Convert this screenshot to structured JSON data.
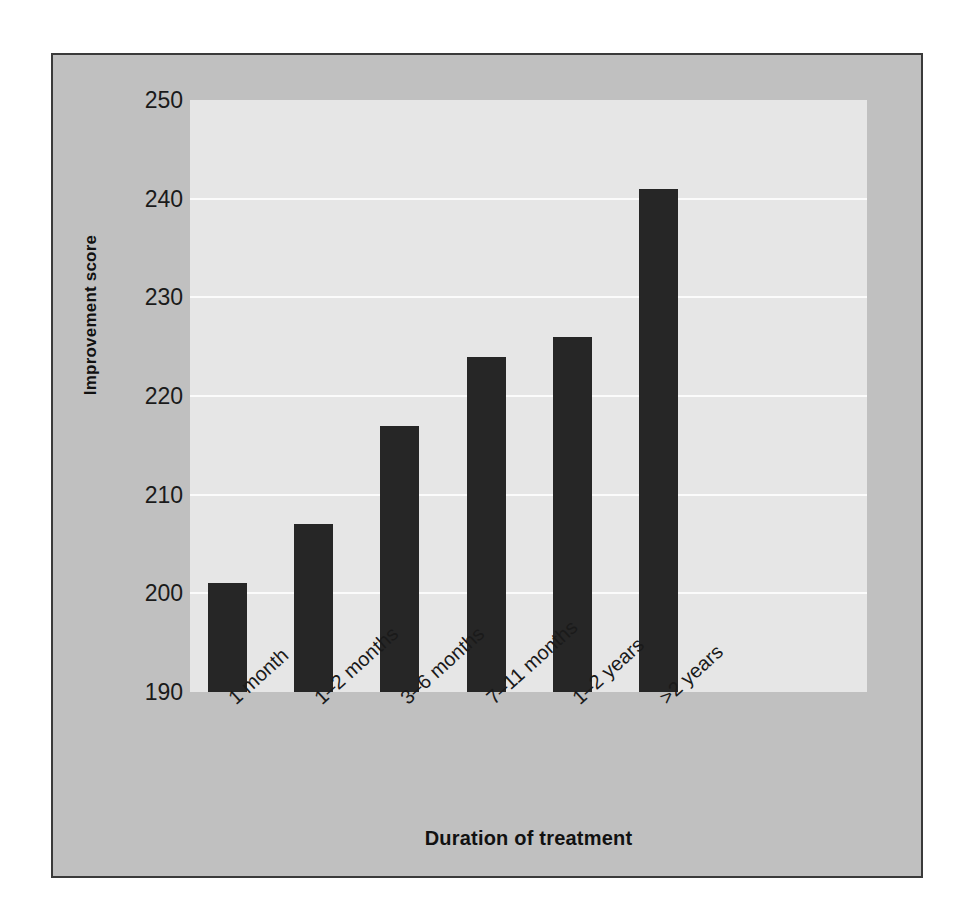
{
  "chart_data": {
    "type": "bar",
    "title": "",
    "xlabel": "Duration of treatment",
    "ylabel": "Improvement score",
    "categories": [
      "1 month",
      "1–2 months",
      "3–6 months",
      "7–11 months",
      "1–2 years",
      ">2 years"
    ],
    "values": [
      201,
      207,
      217,
      224,
      226,
      241
    ],
    "ylim": [
      190,
      250
    ],
    "yticks": [
      190,
      200,
      210,
      220,
      230,
      240,
      250
    ],
    "ytick_labels": [
      "190",
      "200",
      "210",
      "220",
      "230",
      "240",
      "250"
    ],
    "grid": "horizontal",
    "legend": "none",
    "series": [
      {
        "name": "Improvement score",
        "values": [
          201,
          207,
          217,
          224,
          226,
          241
        ]
      }
    ],
    "colors": {
      "bar": "#262626",
      "plot_background": "#e6e6e6",
      "figure_background": "#c0c0c0",
      "figure_border": "#3a3a3a",
      "gridline": "#fbfbfb",
      "text": "#1a1a1a"
    }
  }
}
